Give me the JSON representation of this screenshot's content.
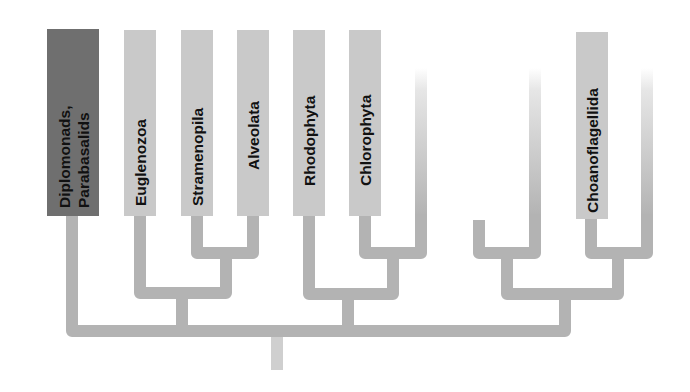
{
  "diagram": {
    "type": "phylogenetic-tree",
    "colors": {
      "background": "#ffffff",
      "branch": "#b3b3b3",
      "root_stub": "#cfcfcf",
      "label_box": "#c9c9c9",
      "highlight_box": "#6f6f6f",
      "label_text": "#111111"
    },
    "taxa": [
      {
        "id": "diplomonads",
        "lines": [
          "Diplomonads,",
          "Parabasalids"
        ],
        "highlighted": true
      },
      {
        "id": "euglenozoa",
        "lines": [
          "Euglenozoa"
        ],
        "highlighted": false
      },
      {
        "id": "stramenopila",
        "lines": [
          "Stramenopila"
        ],
        "highlighted": false
      },
      {
        "id": "alveolata",
        "lines": [
          "Alveolata"
        ],
        "highlighted": false
      },
      {
        "id": "rhodophyta",
        "lines": [
          "Rhodophyta"
        ],
        "highlighted": false
      },
      {
        "id": "chlorophyta",
        "lines": [
          "Chlorophyta"
        ],
        "highlighted": false
      },
      {
        "id": "unlabeled-1",
        "lines": [],
        "highlighted": false
      },
      {
        "id": "unlabeled-2",
        "lines": [],
        "highlighted": false
      },
      {
        "id": "unlabeled-3",
        "lines": [],
        "highlighted": false
      },
      {
        "id": "choanoflagellida",
        "lines": [
          "Choanoflagellida"
        ],
        "highlighted": false
      },
      {
        "id": "unlabeled-4",
        "lines": [],
        "highlighted": false
      }
    ],
    "clades": [
      {
        "name": "stramenopila-alveolata",
        "members": [
          "stramenopila",
          "alveolata"
        ]
      },
      {
        "name": "euglenozoa-group",
        "members": [
          "euglenozoa",
          "stramenopila-alveolata"
        ]
      },
      {
        "name": "chlorophyta-sister",
        "members": [
          "chlorophyta",
          "unlabeled-1"
        ]
      },
      {
        "name": "rhodophyta-group",
        "members": [
          "rhodophyta",
          "chlorophyta-sister"
        ]
      },
      {
        "name": "left-opisthokont-pair",
        "members": [
          "unlabeled-2",
          "unlabeled-3"
        ]
      },
      {
        "name": "choano-pair",
        "members": [
          "choanoflagellida",
          "unlabeled-4"
        ]
      },
      {
        "name": "right-group",
        "members": [
          "left-opisthokont-pair",
          "choano-pair"
        ]
      },
      {
        "name": "root",
        "members": [
          "diplomonads",
          "euglenozoa-group",
          "rhodophyta-group",
          "right-group"
        ]
      }
    ]
  }
}
